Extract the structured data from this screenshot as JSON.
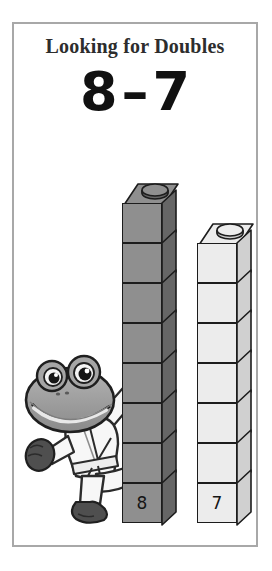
{
  "page": {
    "background_color": "#ffffff"
  },
  "card": {
    "border_color": "#a8a8a8",
    "background_color": "#ffffff",
    "title": "Looking for Doubles",
    "equation": {
      "left_operand": "8",
      "operator": "–",
      "right_operand": "7",
      "full_text": "8 – 7"
    }
  },
  "towers": [
    {
      "id": "gray-tower",
      "label": "8",
      "block_count": 8,
      "color_name": "gray",
      "face_color": "#8f8f8f",
      "side_color": "#666666",
      "outline_color": "#1c1c1c"
    },
    {
      "id": "white-tower",
      "label": "7",
      "block_count": 7,
      "color_name": "white",
      "face_color": "#ececec",
      "side_color": "#d0d0d0",
      "outline_color": "#1c1c1c"
    }
  ],
  "mascot": {
    "name": "karate-frog",
    "description": "cartoon frog in white karate uniform performing a high kick",
    "body_color": "#9a9a9a",
    "uniform_color": "#f7f7f7",
    "hand_foot_color": "#4a4a4a"
  }
}
